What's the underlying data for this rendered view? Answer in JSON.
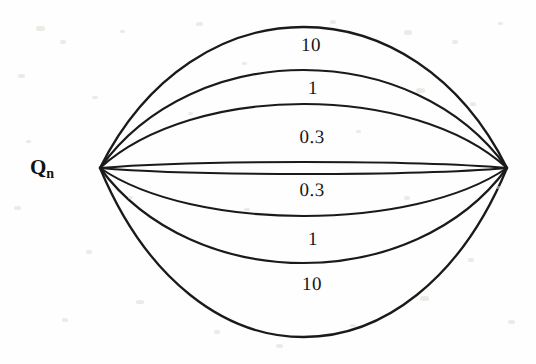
{
  "figure": {
    "background_color": "#fefefe",
    "stroke_color": "#1a1a1a",
    "axis_label": {
      "base": "Q",
      "subscript": "n"
    },
    "geometry": {
      "left_vertex": [
        100,
        168
      ],
      "right_vertex": [
        507,
        168
      ],
      "width": 536,
      "height": 364
    },
    "labels": [
      {
        "text": "10",
        "x": 311,
        "y": 45,
        "position": "upper-outer"
      },
      {
        "text": "1",
        "x": 313,
        "y": 88,
        "position": "upper-mid"
      },
      {
        "text": "0.3",
        "x": 312,
        "y": 137,
        "position": "upper-inner"
      },
      {
        "text": "0.3",
        "x": 312,
        "y": 190,
        "position": "lower-inner"
      },
      {
        "text": "1",
        "x": 313,
        "y": 239,
        "position": "lower-mid"
      },
      {
        "text": "10",
        "x": 312,
        "y": 284,
        "position": "lower-outer"
      }
    ]
  },
  "chart_data": {
    "type": "line",
    "title": "",
    "subtitle": "",
    "xlabel": "",
    "ylabel": "Q_n",
    "legend_position": "inline-annotations",
    "grid": false,
    "x": [
      100,
      507
    ],
    "xlim": [
      100,
      507
    ],
    "ylim": [
      27,
      338
    ],
    "annotations": [
      "10",
      "1",
      "0.3",
      "0.3",
      "1",
      "10"
    ],
    "series": [
      {
        "name": "upper-10",
        "value": 10,
        "side": "upper",
        "apex_y": 27,
        "sag": -141,
        "stroke_width": 2.3
      },
      {
        "name": "upper-1",
        "value": 1,
        "side": "upper",
        "apex_y": 70,
        "sag": -98,
        "stroke_width": 2.2
      },
      {
        "name": "upper-0.3",
        "value": 0.3,
        "side": "upper",
        "apex_y": 104,
        "sag": -64,
        "stroke_width": 2.1
      },
      {
        "name": "upper-0",
        "value": 0,
        "side": "upper",
        "apex_y": 162,
        "sag": -6,
        "stroke_width": 2.1
      },
      {
        "name": "lower-0",
        "value": 0,
        "side": "lower",
        "apex_y": 174,
        "sag": 6,
        "stroke_width": 2.1
      },
      {
        "name": "lower-0.3",
        "value": 0.3,
        "side": "lower",
        "apex_y": 216,
        "sag": 48,
        "stroke_width": 2.1
      },
      {
        "name": "lower-1",
        "value": 1,
        "side": "lower",
        "apex_y": 263,
        "sag": 95,
        "stroke_width": 2.2
      },
      {
        "name": "lower-10",
        "value": 10,
        "side": "lower",
        "apex_y": 337,
        "sag": 169,
        "stroke_width": 2.3
      }
    ]
  }
}
